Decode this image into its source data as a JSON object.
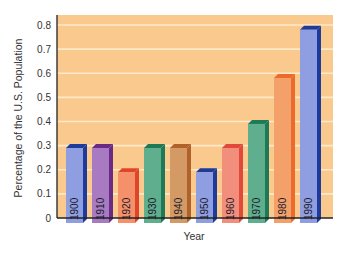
{
  "chart_data": {
    "type": "bar",
    "title": "",
    "xlabel": "Year",
    "ylabel": "Percentage of the U.S. Population",
    "categories": [
      "1900",
      "1910",
      "1920",
      "1930",
      "1940",
      "1950",
      "1960",
      "1970",
      "1980",
      "1990"
    ],
    "values": [
      0.29,
      0.29,
      0.19,
      0.29,
      0.29,
      0.19,
      0.29,
      0.39,
      0.58,
      0.78
    ],
    "ylim": [
      0,
      0.8
    ],
    "yticks": [
      "0",
      "0.1",
      "0.2",
      "0.3",
      "0.4",
      "0.5",
      "0.6",
      "0.7",
      "0.8"
    ],
    "grid": true,
    "legend": "none",
    "bar_label_orientation": "vertical",
    "colors": {
      "plot_background": "#f9c98e",
      "gridline": "#fde9c8",
      "bars": [
        {
          "front": "#8f9ee0",
          "side": "#1e3a9a"
        },
        {
          "front": "#a77ac2",
          "side": "#6a2a86"
        },
        {
          "front": "#f5916a",
          "side": "#e0452a"
        },
        {
          "front": "#5fae8e",
          "side": "#1e7a56"
        },
        {
          "front": "#d39a66",
          "side": "#b0622a"
        },
        {
          "front": "#8f9ee0",
          "side": "#1e3a9a"
        },
        {
          "front": "#f28e7c",
          "side": "#e04a3a"
        },
        {
          "front": "#5fae8e",
          "side": "#1e7a56"
        },
        {
          "front": "#f4a06a",
          "side": "#ec6a2a"
        },
        {
          "front": "#8f9ee0",
          "side": "#1e3a9a"
        }
      ]
    }
  }
}
